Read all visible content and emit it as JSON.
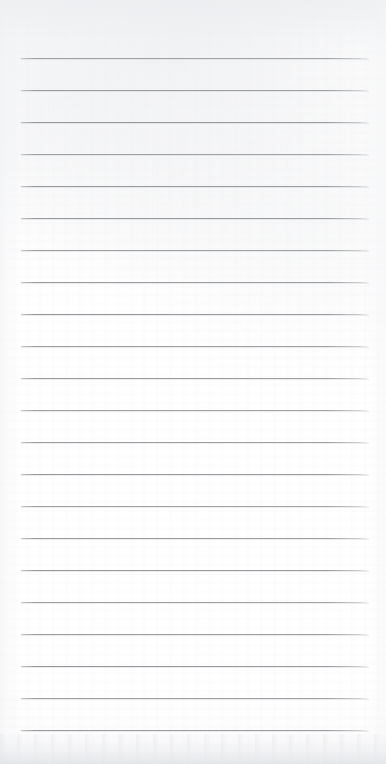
{
  "document": {
    "kind": "scanned-ruled-notepad-page",
    "page_width": 386,
    "page_height": 764,
    "paper_color": "#fdfdfd",
    "content_text": "",
    "has_handwriting": false,
    "has_printed_text": false,
    "has_margin_line": false,
    "has_punch_holes": false
  },
  "ruling": {
    "line_color": "#8c8e93",
    "line_thickness_px": 1,
    "line_count": 22,
    "left_x": 21,
    "right_x": 369,
    "line_length_px": 348,
    "first_line_y": 58,
    "last_line_y": 730,
    "line_spacing_px": 32.0,
    "lines_y": [
      58,
      90,
      122,
      154,
      186,
      218,
      250,
      282,
      314,
      346,
      378,
      410,
      442,
      474,
      506,
      538,
      570,
      602,
      634,
      666,
      698,
      730
    ]
  },
  "margins": {
    "top_px": 58,
    "bottom_px": 34,
    "left_px": 21,
    "right_px": 17
  },
  "scan_artifacts": {
    "bottom_edge_shadow": true,
    "top_edge_haze": true,
    "paper_texture_noise": true,
    "shadow_color": "#e2e3e7"
  }
}
